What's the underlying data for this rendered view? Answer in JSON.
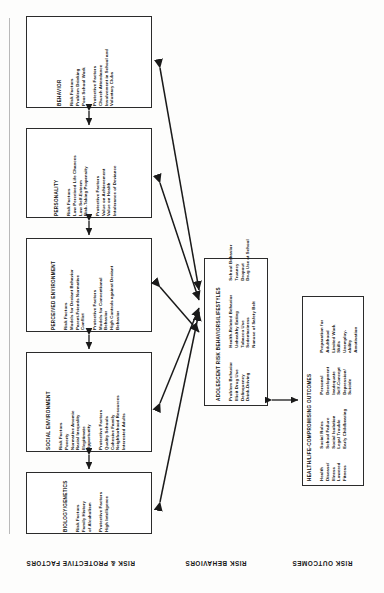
{
  "diagram": {
    "axis_labels": {
      "factors": "RISK & PROTECTIVE FACTORS",
      "behaviors": "RISK BEHAVIORS",
      "outcomes": "RISK OUTCOMES"
    },
    "boxes": [
      {
        "id": "behavior",
        "title": "BEHAVIOR",
        "groups": [
          {
            "heading": "Risk Factors",
            "items": [
              "Problem Drinking",
              "Poor School Work"
            ]
          },
          {
            "heading": "Protective Factors",
            "items": [
              "Church Attendance",
              "Involvement in School and",
              "Voluntary Clubs"
            ]
          }
        ]
      },
      {
        "id": "personality",
        "title": "PERSONALITY",
        "groups": [
          {
            "heading": "Risk Factors",
            "items": [
              "Low Perceived Life Chances",
              "Low Self-Esteem",
              "Risk-Taking Propensity"
            ]
          },
          {
            "heading": "Protective Factors",
            "items": [
              "Value on Achievement",
              "Value on Health",
              "Intolerance of Deviance"
            ]
          }
        ]
      },
      {
        "id": "perceived-environment",
        "title": "PERCEIVED ENVIRONMENT",
        "groups": [
          {
            "heading": "Risk Factors",
            "items": [
              "Models for Deviant Behavior",
              "Parent-Friends Normative",
              "Conflict"
            ]
          },
          {
            "heading": "Protective Factors",
            "items": [
              "Models for Conventional",
              "Behavior",
              "High Controls against Deviant",
              "Behavior"
            ]
          }
        ]
      },
      {
        "id": "social-environment",
        "title": "SOCIAL ENVIRONMENT",
        "groups": [
          {
            "heading": "Risk Factors",
            "items": [
              "Poverty",
              "Normative Anomie",
              "Racial Inequality",
              "Illegitimate",
              "Opportunity"
            ]
          },
          {
            "heading": "Protective Factors",
            "items": [
              "Quality Schools",
              "Cohesive Family",
              "Neighborhood Resources",
              "Interested Adults"
            ]
          }
        ]
      },
      {
        "id": "biology-genetics",
        "title": "BIOLOGY/GENETICS",
        "groups": [
          {
            "heading": "Risk Factors",
            "items": [
              "Family History",
              "of Alcoholism"
            ]
          },
          {
            "heading": "Protective Factors",
            "items": [
              "High Intelligence"
            ]
          }
        ]
      }
    ],
    "center_box": {
      "id": "adolescent-risk-behaviors",
      "title": "ADOLESCENT RISK BEHAVIORS/LIFESTYLES",
      "columns": [
        {
          "heading": "Problem Behavior",
          "items": [
            "Illicit Drug Use",
            "Delinquency",
            "Drink-Driving"
          ]
        },
        {
          "heading": "Health-Related Behavior",
          "items": [
            "Unhealthy Eating",
            "Tobacco Use",
            "Sedentariness",
            "Nonuse of Safety Belt"
          ]
        },
        {
          "heading": "School Behavior",
          "items": [
            "Truancy",
            "Dropout",
            "Drug Use at School"
          ]
        }
      ]
    },
    "outcome_box": {
      "id": "health-life-compromising-outcomes",
      "title": "HEALTH/LIFE-COMPROMISING OUTCOMES",
      "columns": [
        {
          "heading": "Health",
          "items": [
            "Disease/",
            "Illness",
            "Lowered",
            "Fitness"
          ]
        },
        {
          "heading": "Social Roles",
          "items": [
            "School Failure",
            "Social Isolation",
            "Legal Trouble",
            "Early Childbearing"
          ]
        },
        {
          "heading": "Personal",
          "items": [
            "Development",
            "Inadequate",
            "Self-Concept",
            "Depression/",
            "Suicide"
          ]
        },
        {
          "heading": "Preparation for",
          "items": [
            "Adulthood",
            "Limited Work",
            "Skills",
            "Unemploy-",
            "ability",
            "Amotivation"
          ]
        }
      ]
    },
    "colors": {
      "ink": "#2b2b2b",
      "paper": "#fdfdfc",
      "arrow": "#1a1a1a"
    }
  }
}
